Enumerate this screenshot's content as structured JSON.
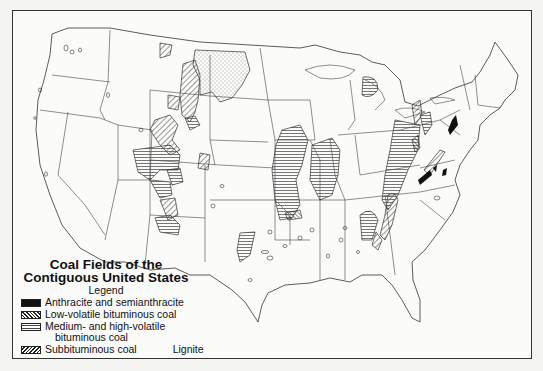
{
  "map": {
    "title_line1": "Coal Fields of the",
    "title_line2": "Contiguous United States",
    "legend_heading": "Legend",
    "legend": [
      {
        "key": "anthracite",
        "label": "Anthracite and semianthracite",
        "pattern": "solid-black"
      },
      {
        "key": "low_volatile",
        "label": "Low-volatile bituminous coal",
        "pattern": "diagonal-hatch-backslash"
      },
      {
        "key": "medium_high_volatile",
        "label_line1": "Medium- and high-volatile",
        "label_line2": "bituminous coal",
        "pattern": "horizontal-lines"
      },
      {
        "key": "subbituminous",
        "label": "Subbituminous coal",
        "pattern": "diagonal-hatch-slash"
      },
      {
        "key": "lignite",
        "label": "Lignite",
        "pattern": "stipple"
      }
    ],
    "colors": {
      "ink": "#222222",
      "paper": "#fbfbf9",
      "border": "#333333"
    }
  }
}
